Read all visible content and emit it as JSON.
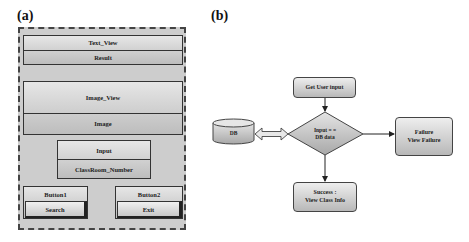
{
  "panel_a": {
    "label": "(a)",
    "text_view": {
      "title": "Text_View",
      "value": "Result"
    },
    "image_view": {
      "title": "Image_View",
      "value": "Image"
    },
    "input": {
      "title": "Input",
      "value": "ClassRoom_Number"
    },
    "button1": {
      "title": "Button1",
      "label": "Search"
    },
    "button2": {
      "title": "Button2",
      "label": "Exit"
    }
  },
  "panel_b": {
    "label": "(b)",
    "start": "Get User input",
    "db": "DB",
    "decision": {
      "line1": "Input = =",
      "line2": "DB data"
    },
    "failure": {
      "line1": "Failure",
      "line2": "View Failure"
    },
    "success": {
      "line1": "Success :",
      "line2": "View Class Info"
    }
  },
  "colors": {
    "panel_bg": "#cdcdcd",
    "box_top": "#e6e6e6",
    "box_bottom": "#bdbdbd",
    "border": "#333333"
  }
}
